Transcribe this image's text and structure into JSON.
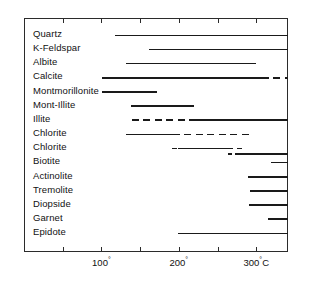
{
  "chart_data": {
    "type": "bar",
    "title": "",
    "subtitle": "",
    "xlabel": "Temperature (°C)",
    "ylabel": "",
    "xlim": [
      0,
      341
    ],
    "grid": false,
    "legend": "none",
    "orientation": "horizontal-range-bars",
    "axis_ticks_major": [
      100,
      200,
      300
    ],
    "axis_ticks_minor": [
      50,
      150,
      250
    ],
    "tick_labels": [
      "100°",
      "200°",
      "300°C"
    ],
    "tick_label_values": [
      100,
      200,
      300
    ],
    "note": "Mineral stability / occurrence temperature ranges. Solid segments = confirmed range, dashed segments = inferred/occasional range. Bars extending to the right plot edge continue beyond 341°C.",
    "categories": [
      "Quartz",
      "K-Feldspar",
      "Albite",
      "Calcite",
      "Montmorillonite",
      "Mont-Illite",
      "Illite",
      "Chlorite",
      "Chlorite",
      "Biotite",
      "Actinolite",
      "Tremolite",
      "Diopside",
      "Garnet",
      "Epidote"
    ],
    "series": [
      {
        "name": "Quartz",
        "segments": [
          {
            "start": 118,
            "end": 341,
            "style": "solid"
          }
        ]
      },
      {
        "name": "K-Feldspar",
        "segments": [
          {
            "start": 161,
            "end": 341,
            "style": "solid"
          }
        ]
      },
      {
        "name": "Albite",
        "segments": [
          {
            "start": 132,
            "end": 300,
            "style": "solid"
          }
        ]
      },
      {
        "name": "Calcite",
        "segments": [
          {
            "start": 101,
            "end": 307,
            "style": "solid"
          },
          {
            "start": 307,
            "end": 341,
            "style": "dashed"
          }
        ]
      },
      {
        "name": "Montmorillonite",
        "segments": [
          {
            "start": 101,
            "end": 172,
            "style": "solid"
          }
        ]
      },
      {
        "name": "Mont-Illite",
        "segments": [
          {
            "start": 138,
            "end": 220,
            "style": "solid"
          }
        ]
      },
      {
        "name": "Illite",
        "segments": [
          {
            "start": 139,
            "end": 214,
            "style": "dashed"
          },
          {
            "start": 214,
            "end": 341,
            "style": "solid"
          }
        ]
      },
      {
        "name": "Chlorite",
        "segments": [
          {
            "start": 132,
            "end": 192,
            "style": "solid"
          },
          {
            "start": 192,
            "end": 296,
            "style": "dashed"
          }
        ]
      },
      {
        "name": "Chlorite",
        "sub_rows": [
          {
            "segments": [
              {
                "start": 191,
                "end": 197,
                "style": "solid"
              },
              {
                "start": 199,
                "end": 270,
                "style": "solid"
              },
              {
                "start": 275,
                "end": 281,
                "style": "solid"
              }
            ]
          },
          {
            "segments": [
              {
                "start": 264,
                "end": 269,
                "style": "solid"
              },
              {
                "start": 272,
                "end": 341,
                "style": "solid"
              }
            ]
          }
        ]
      },
      {
        "name": "Biotite",
        "segments": [
          {
            "start": 319,
            "end": 341,
            "style": "solid"
          }
        ]
      },
      {
        "name": "Actinolite",
        "segments": [
          {
            "start": 289,
            "end": 341,
            "style": "solid"
          }
        ]
      },
      {
        "name": "Tremolite",
        "segments": [
          {
            "start": 292,
            "end": 341,
            "style": "solid"
          }
        ]
      },
      {
        "name": "Diopside",
        "segments": [
          {
            "start": 291,
            "end": 341,
            "style": "solid"
          }
        ]
      },
      {
        "name": "Garnet",
        "segments": [
          {
            "start": 315,
            "end": 341,
            "style": "solid"
          }
        ]
      },
      {
        "name": "Epidote",
        "segments": [
          {
            "start": 199,
            "end": 341,
            "style": "solid"
          }
        ]
      }
    ]
  },
  "labels": {
    "row_0": "Quartz",
    "row_1": "K-Feldspar",
    "row_2": "Albite",
    "row_3": "Calcite",
    "row_4": "Montmorillonite",
    "row_5": "Mont-Illite",
    "row_6": "Illite",
    "row_7": "Chlorite",
    "row_8": "Chlorite",
    "row_9": "Biotite",
    "row_10": "Actinolite",
    "row_11": "Tremolite",
    "row_12": "Diopside",
    "row_13": "Garnet",
    "row_14": "Epidote"
  },
  "axis": {
    "tick_100": "100°",
    "tick_200": "200°",
    "tick_300": "300°C"
  }
}
